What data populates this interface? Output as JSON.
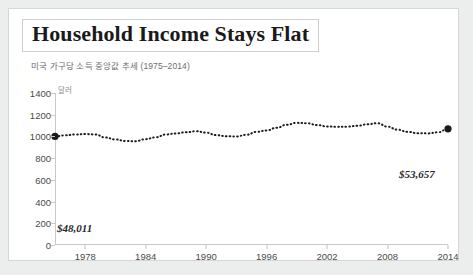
{
  "header": {
    "title": "Household Income Stays Flat",
    "subtitle": "미국 가구당 소득 중앙값 추세 (1975–2014)"
  },
  "axis": {
    "unit_label": "달러"
  },
  "annotations": {
    "start_value_label": "$48,011",
    "end_value_label": "$53,657"
  },
  "colors": {
    "card_background": "#ffffff",
    "page_background": "#eceded",
    "line": "#1a1a1a",
    "axis": "#c9c9c9",
    "tick_text": "#4a4a4a",
    "subtitle_text": "#6d6d6d"
  },
  "chart_data": {
    "type": "line",
    "title": "Household Income Stays Flat",
    "subtitle": "미국 가구당 소득 중앙값 추세 (1975–2014)",
    "xlabel": "",
    "ylabel": "달러",
    "xlim": [
      1975,
      2014
    ],
    "ylim": [
      0,
      1400
    ],
    "ytick_labels": [
      "0",
      "200",
      "400",
      "600",
      "800",
      "1000",
      "1200",
      "1400"
    ],
    "yticks": [
      0,
      200,
      400,
      600,
      800,
      1000,
      1200,
      1400
    ],
    "xtick_labels": [
      "1978",
      "1984",
      "1990",
      "1996",
      "2002",
      "2008",
      "2014"
    ],
    "xticks": [
      1978,
      1984,
      1990,
      1996,
      2002,
      2008,
      2014
    ],
    "grid": false,
    "legend": "none",
    "line_style": "dotted",
    "markers": [
      {
        "x": 1975,
        "y": 1000,
        "label": "$48,011"
      },
      {
        "x": 2014,
        "y": 1070,
        "label": "$53,657"
      }
    ],
    "x": [
      1975,
      1976,
      1977,
      1978,
      1979,
      1980,
      1981,
      1982,
      1983,
      1984,
      1985,
      1986,
      1987,
      1988,
      1989,
      1990,
      1991,
      1992,
      1993,
      1994,
      1995,
      1996,
      1997,
      1998,
      1999,
      2000,
      2001,
      2002,
      2003,
      2004,
      2005,
      2006,
      2007,
      2008,
      2009,
      2010,
      2011,
      2012,
      2013,
      2014
    ],
    "values": [
      1000,
      1010,
      1018,
      1022,
      1018,
      990,
      972,
      958,
      956,
      975,
      992,
      1018,
      1028,
      1038,
      1048,
      1035,
      1012,
      1002,
      1000,
      1015,
      1042,
      1055,
      1080,
      1108,
      1125,
      1122,
      1105,
      1092,
      1088,
      1090,
      1098,
      1112,
      1122,
      1090,
      1062,
      1042,
      1030,
      1028,
      1038,
      1070
    ]
  }
}
